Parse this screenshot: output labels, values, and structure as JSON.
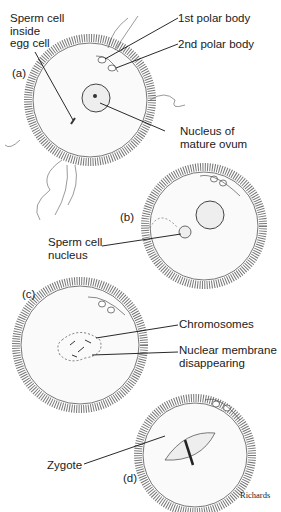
{
  "panels": [
    {
      "id": "a",
      "label": "(a)"
    },
    {
      "id": "b",
      "label": "(b)"
    },
    {
      "id": "c",
      "label": "(c)"
    },
    {
      "id": "d",
      "label": "(d)"
    }
  ],
  "labels": {
    "sperm_inside": "Sperm cell\ninside\negg cell",
    "polar1": "1st polar body",
    "polar2": "2nd polar body",
    "nucleus_ovum": "Nucleus of\nmature ovum",
    "sperm_nucleus": "Sperm cell\nnucleus",
    "chromosomes": "Chromosomes",
    "membrane": "Nuclear membrane\ndisappearing",
    "zygote": "Zygote"
  },
  "credit": "Richards"
}
